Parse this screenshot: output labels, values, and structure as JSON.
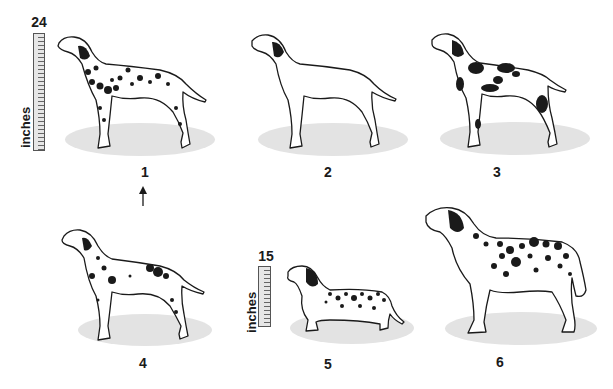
{
  "figure": {
    "rulers": [
      {
        "id": "ruler-large",
        "max_value": "24",
        "unit": "inches"
      },
      {
        "id": "ruler-small",
        "max_value": "15",
        "unit": "inches"
      }
    ],
    "dogs": [
      {
        "number": "1",
        "description": "Dalmatian with small irregular spots, ear patch",
        "marker": "arrow-up"
      },
      {
        "number": "2",
        "description": "Dog-shaped outline, white with dark ear patch, no body spots"
      },
      {
        "number": "3",
        "description": "Dog with large black patches"
      },
      {
        "number": "4",
        "description": "Dalmatian with sparse flecked spots"
      },
      {
        "number": "5",
        "description": "Short-legged long-bodied spotted dog (dachshund-like)"
      },
      {
        "number": "6",
        "description": "Large heavy-set spotted dog with fluffy tail"
      }
    ]
  },
  "colors": {
    "ink": "#1a1a1a",
    "shadow": "#e3e3e3",
    "ruler_fill": "#e6e6e6"
  }
}
